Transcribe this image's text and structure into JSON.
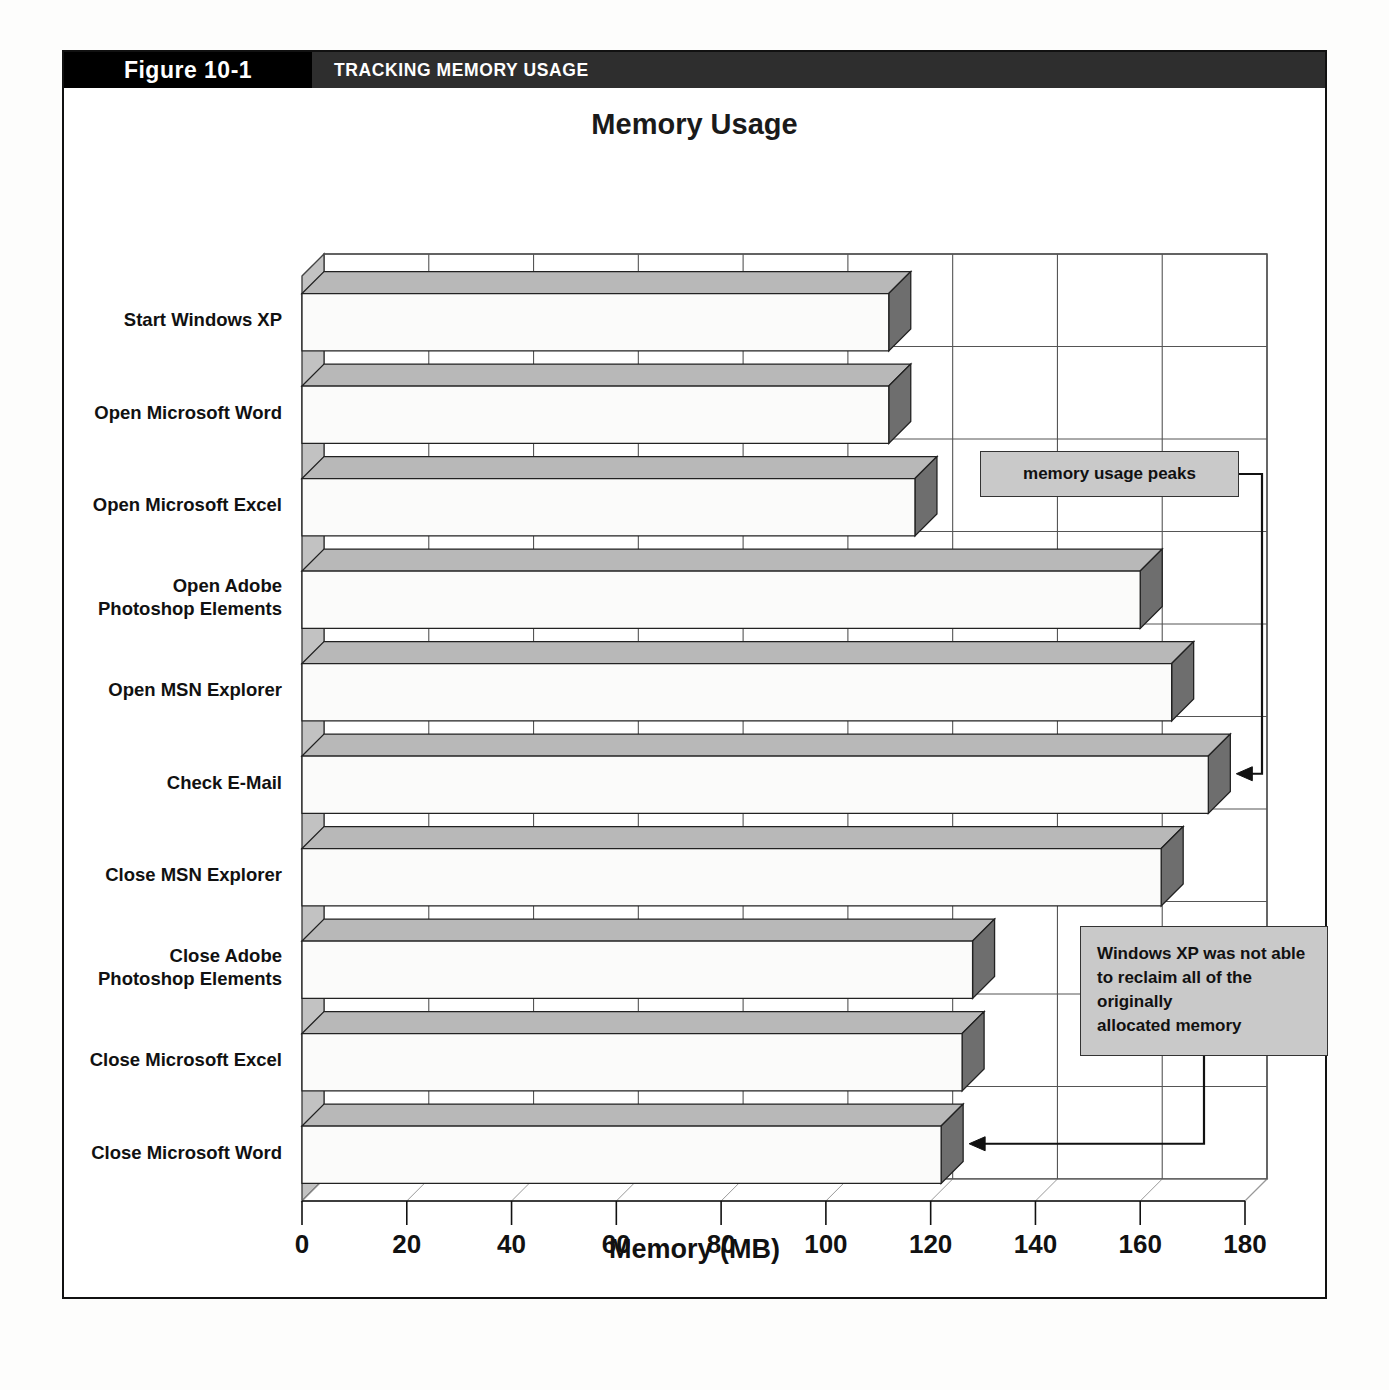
{
  "figure": {
    "number": "Figure 10-1",
    "title": "TRACKING MEMORY USAGE"
  },
  "colors": {
    "caption_number_bg": "#000000",
    "caption_title_bg": "#2e2e2e",
    "caption_text": "#ffffff",
    "bar_face": "#fbfbfa",
    "bar_top": "#b8b8b8",
    "bar_side": "#6e6e6e",
    "wall": "#c2c2c2",
    "floor": "#ffffff",
    "gridline": "#555555",
    "callout_bg": "#c9c9c9",
    "callout_border": "#333333",
    "text": "#111111"
  },
  "annotations": [
    {
      "name": "memory-usage-peaks",
      "text": "memory usage peaks",
      "target_category": "Check E-Mail"
    },
    {
      "name": "reclaim-note",
      "lines": [
        "Windows XP was not able",
        "to reclaim all of the originally",
        "allocated memory"
      ],
      "target_category": "Close Microsoft Word"
    }
  ],
  "chart_data": {
    "type": "bar",
    "orientation": "horizontal",
    "style": "3d",
    "title": "Memory Usage",
    "xlabel": "Memory (MB)",
    "ylabel": "",
    "xlim": [
      0,
      180
    ],
    "xticks": [
      0,
      20,
      40,
      60,
      80,
      100,
      120,
      140,
      160,
      180
    ],
    "ticklabels": [
      "0",
      "20",
      "40",
      "60",
      "80",
      "100",
      "120",
      "140",
      "160",
      "180"
    ],
    "grid": true,
    "legend": false,
    "categories": [
      "Start Windows XP",
      "Open Microsoft Word",
      "Open Microsoft Excel",
      "Open Adobe\nPhotoshop Elements",
      "Open MSN Explorer",
      "Check E-Mail",
      "Close MSN Explorer",
      "Close Adobe\nPhotoshop Elements",
      "Close Microsoft Excel",
      "Close Microsoft Word"
    ],
    "values": [
      112,
      112,
      117,
      160,
      166,
      173,
      164,
      128,
      126,
      122
    ],
    "units": "MB"
  }
}
